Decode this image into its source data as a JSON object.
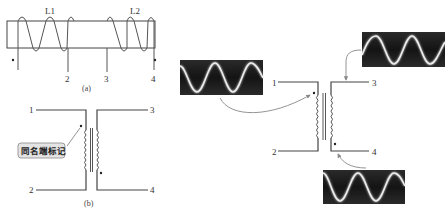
{
  "figure_a": {
    "caption": "(a)",
    "coil_labels": [
      "L1",
      "L2"
    ],
    "terminal_labels": [
      "2",
      "3",
      "4"
    ]
  },
  "figure_b": {
    "caption": "(b)",
    "terminal_labels": [
      "1",
      "2",
      "3",
      "4"
    ],
    "annotation": "同名端标记"
  },
  "figure_c": {
    "terminal_labels": [
      "1",
      "2",
      "3",
      "4"
    ],
    "waveforms": [
      "input-waveform",
      "output-waveform-top",
      "output-waveform-bottom"
    ]
  },
  "colors": {
    "wire": "#444444",
    "scope_bg": "#1c1c1c",
    "scope_trace": "#e8e8e8",
    "annotation_bg": "#e4e4e4",
    "arrow": "#888888"
  }
}
